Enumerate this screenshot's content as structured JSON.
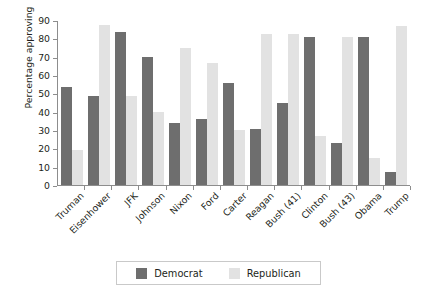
{
  "chart_data": {
    "type": "bar",
    "title": "",
    "subtitle": "",
    "xlabel": "",
    "ylabel": "Percentage approving",
    "ylim": [
      0,
      90
    ],
    "yticks": [
      0,
      10,
      20,
      30,
      40,
      50,
      60,
      70,
      80,
      90
    ],
    "ytick_labels": [
      "0",
      "10",
      "20",
      "30",
      "40",
      "50",
      "60",
      "70",
      "80",
      "90"
    ],
    "grid": false,
    "legend_position": "bottom",
    "categories": [
      "Truman",
      "Eisenhower",
      "JFK",
      "Johnson",
      "Nixon",
      "Ford",
      "Carter",
      "Reagan",
      "Bush (41)",
      "Clinton",
      "Bush (43)",
      "Obama",
      "Trump"
    ],
    "series": [
      {
        "name": "Democrat",
        "color": "#6e6e6e",
        "values": [
          54,
          49,
          84,
          70,
          34,
          36,
          56,
          31,
          45,
          81,
          23,
          81,
          7
        ]
      },
      {
        "name": "Republican",
        "color": "#e2e2e2",
        "values": [
          19,
          88,
          49,
          40,
          75,
          67,
          30,
          83,
          83,
          27,
          81,
          15,
          87
        ]
      }
    ]
  },
  "legend": {
    "items": [
      {
        "label": "Democrat",
        "color": "#6e6e6e"
      },
      {
        "label": "Republican",
        "color": "#e2e2e2"
      }
    ]
  },
  "colors": {
    "democrat": "#6e6e6e",
    "republican": "#e2e2e2",
    "axis": "#8d8d8d",
    "text": "#231f20",
    "legend_border": "#c9c9c9",
    "background": "#ffffff"
  }
}
